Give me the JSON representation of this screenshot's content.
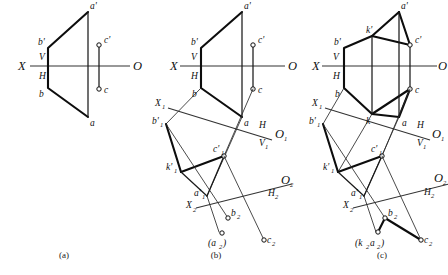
{
  "figure": {
    "background_color": "#ffffff",
    "line_color": "#0d0d0d",
    "axis_color": "#333333",
    "panels": [
      {
        "caption": "(a)",
        "caption_x": 64,
        "caption_y": 256,
        "description": "Front and top views of triangle with points A, B and point C",
        "axis": {
          "x_label": "X",
          "o_label": "O",
          "v_label": "V",
          "h_label": "H",
          "x1": 30,
          "y1": 66,
          "x2": 130,
          "y2": 66
        },
        "points": [
          {
            "name": "a-prime",
            "label": "a'",
            "x": 88,
            "y": 12
          },
          {
            "name": "b-prime",
            "label": "b'",
            "x": 48,
            "y": 48
          },
          {
            "name": "c-prime",
            "label": "c'",
            "x": 99,
            "y": 45
          },
          {
            "name": "b",
            "label": "b",
            "x": 48,
            "y": 88
          },
          {
            "name": "c",
            "label": "c",
            "x": 99,
            "y": 89
          },
          {
            "name": "a",
            "label": "a",
            "x": 88,
            "y": 117
          }
        ]
      },
      {
        "caption": "(b)",
        "caption_x": 216,
        "caption_y": 256,
        "description": "First and second auxiliary views added, edge view and true shape",
        "axis": {
          "x_label": "X",
          "o_label": "O",
          "v_label": "V",
          "h_label": "H",
          "x1": 180,
          "y1": 66,
          "x2": 285,
          "y2": 66
        },
        "aux1": {
          "x_label": "X",
          "x_sub": "1",
          "o_label": "O",
          "o_sub": "1",
          "upper_label": "H",
          "lower_label": "V",
          "lower_sub": "1"
        },
        "aux2": {
          "x_label": "X",
          "x_sub": "2",
          "o_label": "O",
          "o_sub": "2",
          "lower_label": "H",
          "lower_sub": "2"
        },
        "points": [
          {
            "name": "a-prime",
            "label": "a'",
            "x": 242,
            "y": 12
          },
          {
            "name": "b-prime",
            "label": "b'",
            "x": 201,
            "y": 48
          },
          {
            "name": "c-prime",
            "label": "c'",
            "x": 253,
            "y": 45
          },
          {
            "name": "b",
            "label": "b",
            "x": 201,
            "y": 88
          },
          {
            "name": "c",
            "label": "c",
            "x": 253,
            "y": 89
          },
          {
            "name": "a",
            "label": "a",
            "x": 242,
            "y": 117
          },
          {
            "name": "b1-prime",
            "label": "b'",
            "sub": "1",
            "x": 166,
            "y": 124
          },
          {
            "name": "c1-prime",
            "label": "c'",
            "sub": "1",
            "x": 224,
            "y": 156
          },
          {
            "name": "k1-prime",
            "label": "k'",
            "sub": "1",
            "x": 181,
            "y": 172
          },
          {
            "name": "a1-prime",
            "label": "a'",
            "sub": "1",
            "x": 207,
            "y": 196
          },
          {
            "name": "b2",
            "label": "b",
            "sub": "2",
            "x": 228,
            "y": 218
          },
          {
            "name": "a2",
            "label": "(a",
            "sub": "2",
            "suffix": ")",
            "x": 219,
            "y": 238
          },
          {
            "name": "c2",
            "label": "c",
            "sub": "2",
            "x": 264,
            "y": 240
          }
        ]
      },
      {
        "caption": "(c)",
        "caption_x": 382,
        "caption_y": 256,
        "description": "Complete solution including point K on line AB, true shape in second auxiliary",
        "axis": {
          "x_label": "X",
          "o_label": "O",
          "v_label": "V",
          "h_label": "H",
          "x1": 322,
          "y1": 66,
          "x2": 437,
          "y2": 66
        },
        "aux1": {
          "x_label": "X",
          "x_sub": "1",
          "o_label": "O",
          "o_sub": "1",
          "upper_label": "H",
          "lower_label": "V",
          "lower_sub": "1"
        },
        "aux2": {
          "x_label": "X",
          "x_sub": "2",
          "o_label": "O",
          "o_sub": "2",
          "lower_label": "H",
          "lower_sub": "2"
        },
        "points": [
          {
            "name": "a-prime",
            "label": "a'",
            "x": 399,
            "y": 12
          },
          {
            "name": "k-prime",
            "label": "k'",
            "x": 372,
            "y": 36
          },
          {
            "name": "b-prime",
            "label": "b'",
            "x": 344,
            "y": 48
          },
          {
            "name": "c-prime",
            "label": "c'",
            "x": 410,
            "y": 45
          },
          {
            "name": "b",
            "label": "b",
            "x": 344,
            "y": 88
          },
          {
            "name": "c",
            "label": "c",
            "x": 410,
            "y": 89
          },
          {
            "name": "k",
            "label": "k",
            "x": 372,
            "y": 114
          },
          {
            "name": "a",
            "label": "a",
            "x": 399,
            "y": 117
          },
          {
            "name": "b1-prime",
            "label": "b'",
            "sub": "1",
            "x": 323,
            "y": 124
          },
          {
            "name": "c1-prime",
            "label": "c'",
            "sub": "1",
            "x": 382,
            "y": 156
          },
          {
            "name": "k1-prime",
            "label": "k'",
            "sub": "1",
            "x": 338,
            "y": 172
          },
          {
            "name": "a1-prime",
            "label": "a'",
            "sub": "1",
            "x": 364,
            "y": 196
          },
          {
            "name": "b2",
            "label": "b",
            "sub": "2",
            "x": 385,
            "y": 218
          },
          {
            "name": "k2a2",
            "label": "(k",
            "sub": "2",
            "label2": "a",
            "sub2": "2",
            "suffix": ")",
            "x": 370,
            "y": 238
          },
          {
            "name": "c2",
            "label": "c",
            "sub": "2",
            "x": 421,
            "y": 240
          }
        ]
      }
    ]
  }
}
